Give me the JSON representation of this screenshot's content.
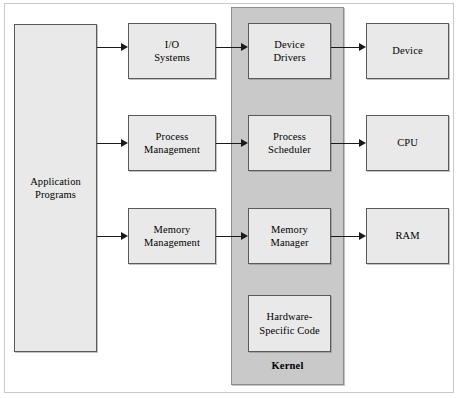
{
  "diagram": {
    "kernel_label": "Kernel",
    "colors": {
      "box_fill": "#e9e9e9",
      "box_border": "#5a5a5a",
      "kernel_fill": "#c9c9c9",
      "kernel_border": "#8d8d8d",
      "arrow": "#1a1a1a",
      "background": "#ffffff",
      "frame_border": "#c9c9c9"
    },
    "columns": {
      "application": {
        "label": "Application\nPrograms"
      },
      "services": {
        "items": [
          {
            "label": "I/O\nSystems"
          },
          {
            "label": "Process\nManagement"
          },
          {
            "label": "Memory\nManagement"
          }
        ]
      },
      "kernel": {
        "label": "Kernel",
        "items": [
          {
            "label": "Device\nDrivers"
          },
          {
            "label": "Process\nScheduler"
          },
          {
            "label": "Memory\nManager"
          },
          {
            "label": "Hardware-\nSpecific Code"
          }
        ]
      },
      "hardware": {
        "items": [
          {
            "label": "Device"
          },
          {
            "label": "CPU"
          },
          {
            "label": "RAM"
          }
        ]
      }
    },
    "arrows": [
      {
        "name": "app-to-io",
        "from": "Application Programs",
        "to": "I/O Systems"
      },
      {
        "name": "app-to-process-management",
        "from": "Application Programs",
        "to": "Process Management"
      },
      {
        "name": "app-to-memory-management",
        "from": "Application Programs",
        "to": "Memory Management"
      },
      {
        "name": "io-to-device-drivers",
        "from": "I/O Systems",
        "to": "Device Drivers"
      },
      {
        "name": "process-management-to-scheduler",
        "from": "Process Management",
        "to": "Process Scheduler"
      },
      {
        "name": "memory-management-to-manager",
        "from": "Memory Management",
        "to": "Memory Manager"
      },
      {
        "name": "device-drivers-to-device",
        "from": "Device Drivers",
        "to": "Device"
      },
      {
        "name": "scheduler-to-cpu",
        "from": "Process Scheduler",
        "to": "CPU"
      },
      {
        "name": "memory-manager-to-ram",
        "from": "Memory Manager",
        "to": "RAM"
      }
    ]
  }
}
